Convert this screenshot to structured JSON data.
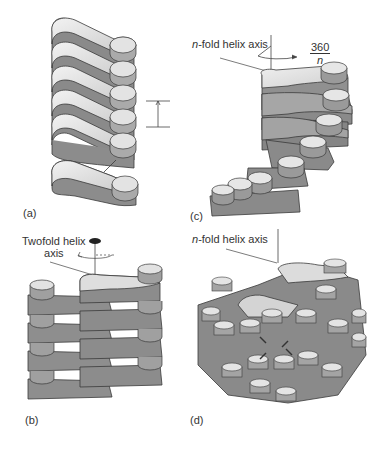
{
  "figure": {
    "panels": [
      {
        "id": "a",
        "label": "(a)",
        "description": "Stack of identical subunits related by pure translation"
      },
      {
        "id": "b",
        "label": "(b)",
        "description": "Subunits arranged along a twofold helix axis",
        "axis_label_line1": "Twofold helix",
        "axis_label_line2": "axis"
      },
      {
        "id": "c",
        "label": "(c)",
        "description": "Subunits arranged along an n-fold helix axis with rotation",
        "axis_label_italic": "n",
        "axis_label_rest": "-fold helix axis",
        "rotation_numerator": "360",
        "rotation_denominator": "n"
      },
      {
        "id": "d",
        "label": "(d)",
        "description": "Dense helical packing about an n-fold helix axis",
        "axis_label_italic": "n",
        "axis_label_rest": "-fold helix axis"
      }
    ],
    "colors": {
      "top_face": "#d9d9d9",
      "top_highlight": "#efefef",
      "side_face": "#8c8c8c",
      "side_dark": "#6e6e6e",
      "outline": "#3a3a3a",
      "axis_line": "#444444"
    }
  }
}
